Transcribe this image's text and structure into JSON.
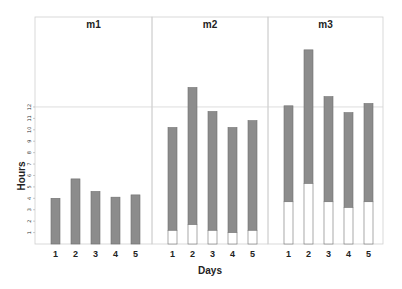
{
  "chart_data": {
    "type": "bar",
    "subtype": "stacked, faceted",
    "title": "",
    "xlabel": "Days",
    "ylabel": "Hours",
    "categories": [
      "1",
      "2",
      "3",
      "4",
      "5"
    ],
    "yticks": [
      1,
      2,
      3,
      4,
      5,
      6,
      7,
      8,
      9,
      10,
      11,
      12
    ],
    "ylim": [
      0,
      17.5
    ],
    "reference_line": 12,
    "grid": false,
    "legend": null,
    "colors": {
      "upper": "#8c8c8c",
      "lower": "#ffffff",
      "border": "#6e6e6e",
      "panel_border": "#cfcfcf"
    },
    "panels": [
      {
        "label": "m1",
        "series": [
          {
            "name": "lower (white)",
            "values": [
              0,
              0,
              0,
              0,
              0
            ]
          },
          {
            "name": "upper (gray)",
            "values": [
              4.0,
              5.7,
              4.6,
              4.1,
              4.3
            ]
          }
        ],
        "totals": [
          4.0,
          5.7,
          4.6,
          4.1,
          4.3
        ]
      },
      {
        "label": "m2",
        "series": [
          {
            "name": "lower (white)",
            "values": [
              1.2,
              1.7,
              1.2,
              1.0,
              1.2
            ]
          },
          {
            "name": "upper (gray)",
            "values": [
              9.0,
              12.0,
              10.4,
              9.2,
              9.6
            ]
          }
        ],
        "totals": [
          10.2,
          13.7,
          11.6,
          10.2,
          10.8
        ]
      },
      {
        "label": "m3",
        "series": [
          {
            "name": "lower (white)",
            "values": [
              3.7,
              5.3,
              3.7,
              3.2,
              3.7
            ]
          },
          {
            "name": "upper (gray)",
            "values": [
              8.4,
              11.7,
              9.2,
              8.3,
              8.6
            ]
          }
        ],
        "totals": [
          12.1,
          17.0,
          12.9,
          11.5,
          12.3
        ]
      }
    ]
  }
}
